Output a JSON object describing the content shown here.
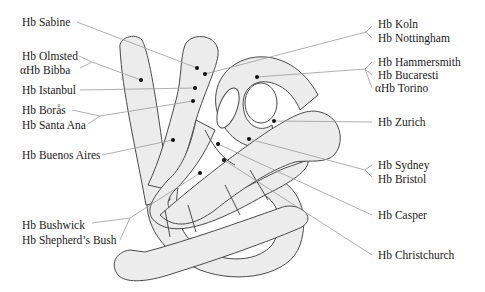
{
  "figure": {
    "type": "protein ribbon diagram",
    "colors": {
      "ribbon_fill": "#ececec",
      "ribbon_stroke": "#4a4a4a",
      "leader_line": "#9a9a9a",
      "site_dot": "#111111",
      "text": "#1a1a1a",
      "background": "#ffffff"
    }
  },
  "labels": {
    "left": [
      {
        "id": "sabine",
        "lines": [
          "Hb Sabine"
        ]
      },
      {
        "id": "olmsted_bibba",
        "lines": [
          "Hb Olmsted",
          "αHb Bibba"
        ]
      },
      {
        "id": "istanbul",
        "lines": [
          "Hb Istanbul"
        ]
      },
      {
        "id": "boras_santa_ana",
        "lines": [
          "Hb Borås",
          "Hb Santa Ana"
        ]
      },
      {
        "id": "buenos_aires",
        "lines": [
          "Hb Buenos Aires"
        ]
      },
      {
        "id": "bushwick_shepherds_bush",
        "lines": [
          "Hb Bushwick",
          "Hb Shepherd’s Bush"
        ]
      }
    ],
    "right": [
      {
        "id": "koln_nottingham",
        "lines": [
          "Hb Koln",
          "Hb Nottingham"
        ]
      },
      {
        "id": "hammersmith_bucaresti_torino",
        "lines": [
          "Hb Hammersmith",
          "Hb Bucaresti",
          "αHb Torino"
        ]
      },
      {
        "id": "zurich",
        "lines": [
          "Hb Zurich"
        ]
      },
      {
        "id": "sydney_bristol",
        "lines": [
          "Hb Sydney",
          "Hb Bristol"
        ]
      },
      {
        "id": "casper",
        "lines": [
          "Hb Casper"
        ]
      },
      {
        "id": "christchurch",
        "lines": [
          "Hb Christchurch"
        ]
      }
    ]
  }
}
